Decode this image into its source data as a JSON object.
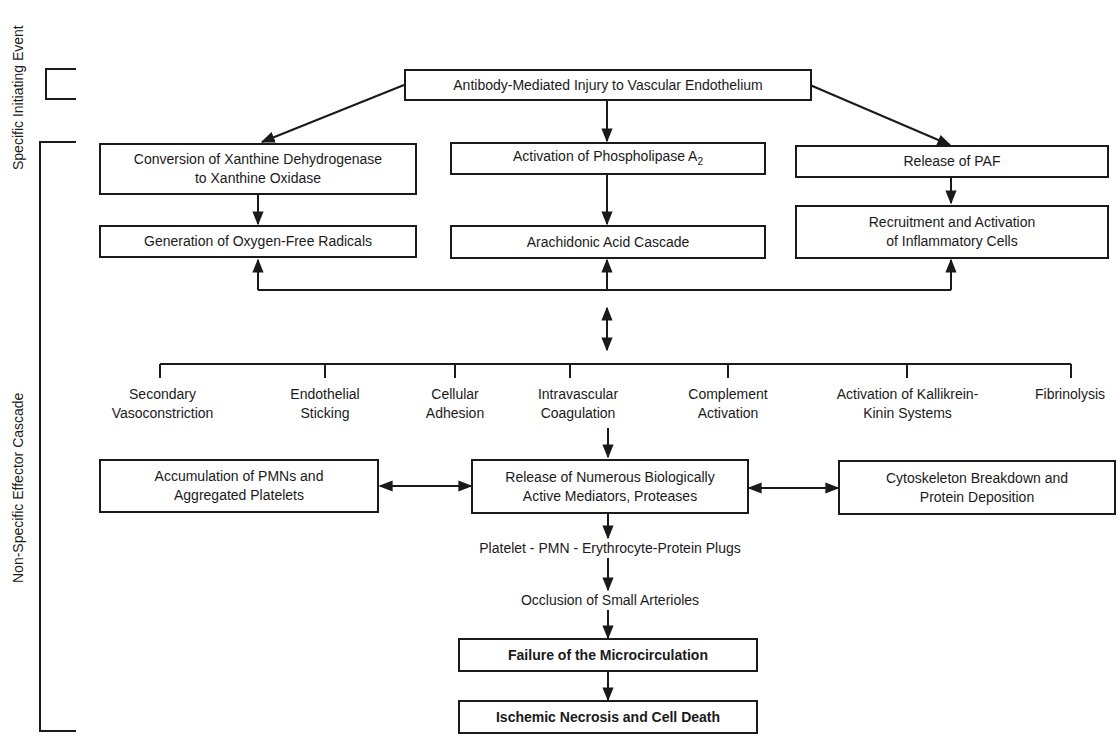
{
  "side_labels": {
    "specific": "Specific Initiating Event",
    "nonspecific": "Non-Specific Effector Cascade"
  },
  "nodes": {
    "root": "Antibody-Mediated Injury to Vascular Endothelium",
    "xanthine_line1": "Conversion of Xanthine Dehydrogenase",
    "xanthine_line2": "to Xanthine Oxidase",
    "phospholipase": "Activation of Phospholipase A",
    "phospholipase_sub": "2",
    "paf": "Release of PAF",
    "oxygen": "Generation of Oxygen-Free Radicals",
    "arachidonic": "Arachidonic Acid Cascade",
    "recruit_line1": "Recruitment and Activation",
    "recruit_line2": "of Inflammatory Cells",
    "pmn_line1": "Accumulation of PMNs and",
    "pmn_line2": "Aggregated Platelets",
    "mediators_line1": "Release of Numerous Biologically",
    "mediators_line2": "Active Mediators, Proteases",
    "cyto_line1": "Cytoskeleton Breakdown and",
    "cyto_line2": "Protein Deposition",
    "plugs": "Platelet - PMN - Erythrocyte-Protein Plugs",
    "occlusion": "Occlusion of Small Arterioles",
    "failure": "Failure of the Microcirculation",
    "necrosis": "Ischemic Necrosis and Cell Death"
  },
  "effectors": [
    {
      "line1": "Secondary",
      "line2": "Vasoconstriction"
    },
    {
      "line1": "Endothelial",
      "line2": "Sticking"
    },
    {
      "line1": "Cellular",
      "line2": "Adhesion"
    },
    {
      "line1": "Intravascular",
      "line2": "Coagulation"
    },
    {
      "line1": "Complement",
      "line2": "Activation"
    },
    {
      "line1": "Activation of Kallikrein-",
      "line2": "Kinin Systems"
    },
    {
      "line1": "Fibrinolysis",
      "line2": ""
    }
  ]
}
